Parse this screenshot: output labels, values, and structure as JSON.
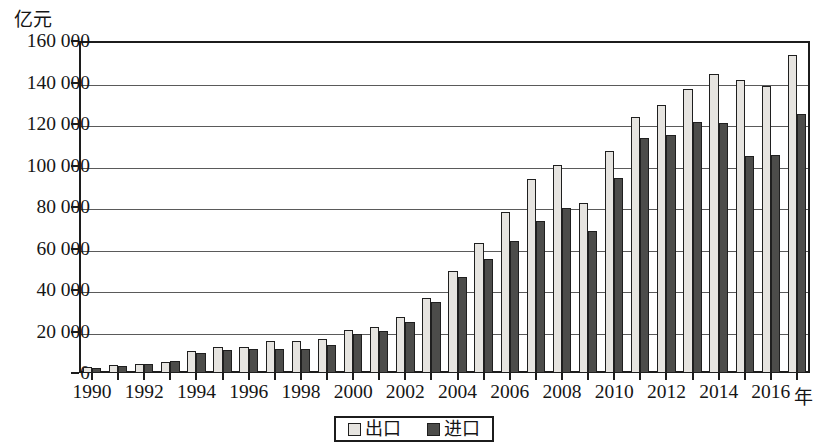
{
  "chart_data": {
    "type": "bar",
    "title": "",
    "subtitle": "",
    "xlabel": "年",
    "ylabel": "亿元",
    "ylim": [
      0,
      160000
    ],
    "ytick_step": 20000,
    "ytick_labels": [
      "160 000",
      "140 000",
      "120 000",
      "100 000",
      "80 000",
      "60 000",
      "40 000",
      "20 000",
      "0"
    ],
    "ytick_values": [
      160000,
      140000,
      120000,
      100000,
      80000,
      60000,
      40000,
      20000,
      0
    ],
    "grid": true,
    "grid_axis": "y",
    "legend_position": "bottom-center",
    "categories": [
      1990,
      1991,
      1992,
      1993,
      1994,
      1995,
      1996,
      1997,
      1998,
      1999,
      2000,
      2001,
      2002,
      2003,
      2004,
      2005,
      2006,
      2007,
      2008,
      2009,
      2010,
      2011,
      2012,
      2013,
      2014,
      2015,
      2016,
      2017
    ],
    "xtick_labels": [
      "1990",
      "1992",
      "1994",
      "1996",
      "1998",
      "2000",
      "2002",
      "2004",
      "2006",
      "2008",
      "2010",
      "2012",
      "2014",
      "2016"
    ],
    "xtick_years": [
      1990,
      1992,
      1994,
      1996,
      1998,
      2000,
      2002,
      2004,
      2006,
      2008,
      2010,
      2012,
      2014,
      2016
    ],
    "series": [
      {
        "name": "出口",
        "color": "#e6e4e0",
        "values": [
          3000,
          3800,
          4300,
          5300,
          10400,
          12500,
          12600,
          15200,
          15200,
          16200,
          20600,
          22000,
          27000,
          36300,
          49100,
          62600,
          77600,
          93600,
          100400,
          82000,
          107000,
          123200,
          129400,
          137100,
          143900,
          141200,
          138400,
          153300
        ]
      },
      {
        "name": "进口",
        "color": "#4c4c4a",
        "values": [
          2600,
          3400,
          4400,
          6000,
          9600,
          11000,
          11600,
          11800,
          11600,
          13700,
          18600,
          20200,
          24400,
          34200,
          46400,
          54800,
          63400,
          73300,
          79500,
          68600,
          94000,
          113100,
          114800,
          121000,
          120400,
          104500,
          104900,
          124800
        ]
      }
    ]
  },
  "legend": {
    "items": [
      {
        "label": "出口",
        "color": "#e6e4e0"
      },
      {
        "label": "进口",
        "color": "#4c4c4a"
      }
    ]
  },
  "axes": {
    "y_unit": "亿元",
    "x_unit": "年"
  }
}
